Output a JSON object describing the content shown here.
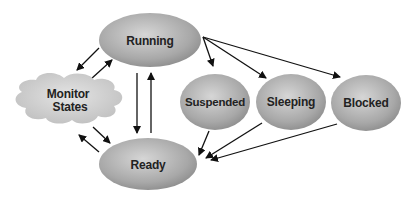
{
  "diagram": {
    "type": "state-diagram",
    "nodes": [
      {
        "id": "running",
        "label": "Running",
        "shape": "ellipse"
      },
      {
        "id": "monitor",
        "label_line1": "Monitor",
        "label_line2": "States",
        "shape": "cloud"
      },
      {
        "id": "suspended",
        "label": "Suspended",
        "shape": "ellipse"
      },
      {
        "id": "sleeping",
        "label": "Sleeping",
        "shape": "ellipse"
      },
      {
        "id": "blocked",
        "label": "Blocked",
        "shape": "ellipse"
      },
      {
        "id": "ready",
        "label": "Ready",
        "shape": "ellipse"
      }
    ],
    "edges": [
      {
        "from": "running",
        "to": "monitor"
      },
      {
        "from": "monitor",
        "to": "running"
      },
      {
        "from": "running",
        "to": "ready"
      },
      {
        "from": "ready",
        "to": "running"
      },
      {
        "from": "running",
        "to": "suspended"
      },
      {
        "from": "running",
        "to": "sleeping"
      },
      {
        "from": "running",
        "to": "blocked"
      },
      {
        "from": "monitor",
        "to": "ready"
      },
      {
        "from": "ready",
        "to": "monitor"
      },
      {
        "from": "suspended",
        "to": "ready"
      },
      {
        "from": "sleeping",
        "to": "ready"
      },
      {
        "from": "blocked",
        "to": "ready"
      }
    ],
    "colors": {
      "node_fill": "#9a9a9a",
      "node_highlight": "#d4d4d4",
      "cloud_fill": "#c8c8c8",
      "arrow": "#111111",
      "text": "#222222"
    }
  }
}
